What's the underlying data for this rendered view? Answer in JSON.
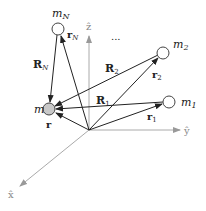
{
  "diagram": {
    "axes": {
      "z": {
        "label": "ẑ",
        "color": "#999999"
      },
      "y": {
        "label": "ŷ",
        "color": "#999999"
      },
      "x": {
        "label": "x̂",
        "color": "#999999"
      }
    },
    "bodies": [
      {
        "id": "m",
        "label": "m",
        "fill": "#c8c8c8",
        "vector_label": "r"
      },
      {
        "id": "m1",
        "label": "m",
        "sub": "1",
        "fill": "#ffffff",
        "vector_label": "r",
        "vector_sub": "1",
        "rel_label": "R",
        "rel_sub": "1"
      },
      {
        "id": "m2",
        "label": "m",
        "sub": "2",
        "fill": "#ffffff",
        "vector_label": "r",
        "vector_sub": "2",
        "rel_label": "R",
        "rel_sub": "2"
      },
      {
        "id": "mN",
        "label": "m",
        "sub": "N",
        "fill": "#ffffff",
        "vector_label": "r",
        "vector_sub": "N",
        "rel_label": "R",
        "rel_sub": "N"
      }
    ],
    "ellipsis": "..."
  }
}
